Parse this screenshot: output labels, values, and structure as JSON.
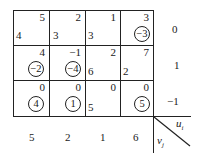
{
  "table": {
    "rows": [
      {
        "u": "0",
        "cells": [
          {
            "cost": "5",
            "alloc": "4",
            "check": null
          },
          {
            "cost": "2",
            "alloc": "3",
            "check": null
          },
          {
            "cost": "1",
            "alloc": "3",
            "check": null
          },
          {
            "cost": "3",
            "alloc": null,
            "check": "−3"
          }
        ]
      },
      {
        "u": "1",
        "cells": [
          {
            "cost": "4",
            "alloc": null,
            "check": "−2"
          },
          {
            "cost": "−1",
            "alloc": null,
            "check": "−4"
          },
          {
            "cost": "2",
            "alloc": "6",
            "check": null
          },
          {
            "cost": "7",
            "alloc": "2",
            "check": null
          }
        ]
      },
      {
        "u": "−1",
        "cells": [
          {
            "cost": "0",
            "alloc": null,
            "check": "4"
          },
          {
            "cost": "0",
            "alloc": null,
            "check": "1"
          },
          {
            "cost": "0",
            "alloc": "5",
            "check": null
          },
          {
            "cost": "0",
            "alloc": null,
            "check": "5"
          }
        ]
      }
    ],
    "v": [
      "5",
      "2",
      "1",
      "6"
    ],
    "corner": {
      "u_label": "u",
      "u_sub": "i",
      "v_label": "v",
      "v_sub": "j"
    }
  }
}
